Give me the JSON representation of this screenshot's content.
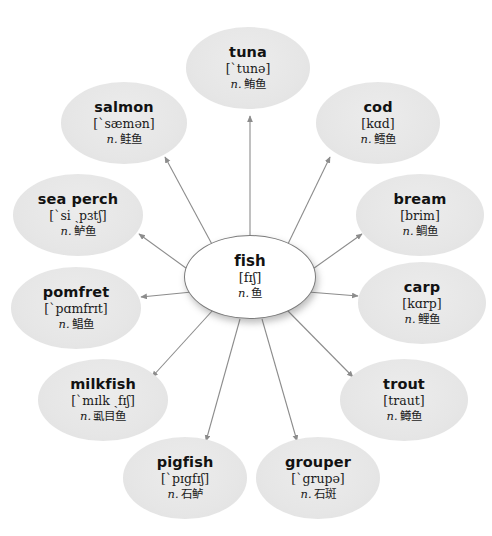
{
  "diagram": {
    "type": "radial-mind-map",
    "background_color": "#ffffff",
    "node_fill": "#e8e8e8",
    "root_fill": "#ffffff",
    "edge_color": "#8c8c8c",
    "text_color": "#121212"
  },
  "root": {
    "word": "fish",
    "ipa": "[fɪʃ]",
    "pos": "n.",
    "gloss": "鱼",
    "cx": 250,
    "cy": 277,
    "rx": 66,
    "ry": 42
  },
  "leaves": [
    {
      "id": "tuna",
      "word": "tuna",
      "ipa": "[ˋtunə]",
      "pos": "n.",
      "gloss": "鲔鱼",
      "cx": 248,
      "cy": 68,
      "rx": 62,
      "ry": 41
    },
    {
      "id": "salmon",
      "word": "salmon",
      "ipa": "[ˋsæmən]",
      "pos": "n.",
      "gloss": "鲑鱼",
      "cx": 124,
      "cy": 123,
      "rx": 63,
      "ry": 41
    },
    {
      "id": "cod",
      "word": "cod",
      "ipa": "[kɑd]",
      "pos": "n.",
      "gloss": "鳕鱼",
      "cx": 378,
      "cy": 123,
      "rx": 62,
      "ry": 41
    },
    {
      "id": "sea-perch",
      "word": "sea perch",
      "ipa": "[ˋsi ˏpɜtʃ]",
      "pos": "n.",
      "gloss": "鲈鱼",
      "cx": 78,
      "cy": 215,
      "rx": 65,
      "ry": 41
    },
    {
      "id": "bream",
      "word": "bream",
      "ipa": "[brim]",
      "pos": "n.",
      "gloss": "鲷鱼",
      "cx": 420,
      "cy": 215,
      "rx": 64,
      "ry": 41
    },
    {
      "id": "pomfret",
      "word": "pomfret",
      "ipa": "[ˋpɑmfrɪt]",
      "pos": "n.",
      "gloss": "鲳鱼",
      "cx": 76,
      "cy": 308,
      "rx": 65,
      "ry": 41
    },
    {
      "id": "carp",
      "word": "carp",
      "ipa": "[kɑrp]",
      "pos": "n.",
      "gloss": "鲤鱼",
      "cx": 422,
      "cy": 303,
      "rx": 64,
      "ry": 41
    },
    {
      "id": "milkfish",
      "word": "milkfish",
      "ipa": "[ˋmɪlk ˏfɪʃ]",
      "pos": "n.",
      "gloss": "虱目鱼",
      "cx": 103,
      "cy": 400,
      "rx": 65,
      "ry": 41
    },
    {
      "id": "trout",
      "word": "trout",
      "ipa": "[traut]",
      "pos": "n.",
      "gloss": "鳟鱼",
      "cx": 404,
      "cy": 400,
      "rx": 64,
      "ry": 41
    },
    {
      "id": "pigfish",
      "word": "pigfish",
      "ipa": "[ˋpɪgfɪʃ]",
      "pos": "n.",
      "gloss": "石鲈",
      "cx": 185,
      "cy": 478,
      "rx": 62,
      "ry": 41
    },
    {
      "id": "grouper",
      "word": "grouper",
      "ipa": "[ˋgrupə]",
      "pos": "n.",
      "gloss": "石斑",
      "cx": 318,
      "cy": 478,
      "rx": 62,
      "ry": 41
    }
  ],
  "edges": [
    {
      "id": "fish-to-tuna",
      "from": "fish",
      "to": "tuna",
      "x1": 250,
      "y1": 236,
      "x2": 250,
      "y2": 116
    },
    {
      "id": "fish-to-salmon",
      "from": "fish",
      "to": "salmon",
      "x1": 214,
      "y1": 248,
      "x2": 165,
      "y2": 157
    },
    {
      "id": "fish-to-cod",
      "from": "fish",
      "to": "cod",
      "x1": 286,
      "y1": 248,
      "x2": 330,
      "y2": 157
    },
    {
      "id": "fish-to-sea-perch",
      "from": "fish",
      "to": "sea-perch",
      "x1": 190,
      "y1": 271,
      "x2": 139,
      "y2": 234
    },
    {
      "id": "fish-to-bream",
      "from": "fish",
      "to": "bream",
      "x1": 310,
      "y1": 271,
      "x2": 362,
      "y2": 234
    },
    {
      "id": "fish-to-pomfret",
      "from": "fish",
      "to": "pomfret",
      "x1": 192,
      "y1": 292,
      "x2": 141,
      "y2": 297
    },
    {
      "id": "fish-to-carp",
      "from": "fish",
      "to": "carp",
      "x1": 308,
      "y1": 292,
      "x2": 358,
      "y2": 296
    },
    {
      "id": "fish-to-milkfish",
      "from": "fish",
      "to": "milkfish",
      "x1": 213,
      "y1": 310,
      "x2": 152,
      "y2": 377
    },
    {
      "id": "fish-to-trout",
      "from": "fish",
      "to": "trout",
      "x1": 287,
      "y1": 310,
      "x2": 353,
      "y2": 377
    },
    {
      "id": "fish-to-pigfish",
      "from": "fish",
      "to": "pigfish",
      "x1": 240,
      "y1": 319,
      "x2": 206,
      "y2": 441
    },
    {
      "id": "fish-to-grouper",
      "from": "fish",
      "to": "grouper",
      "x1": 262,
      "y1": 319,
      "x2": 297,
      "y2": 441
    }
  ]
}
